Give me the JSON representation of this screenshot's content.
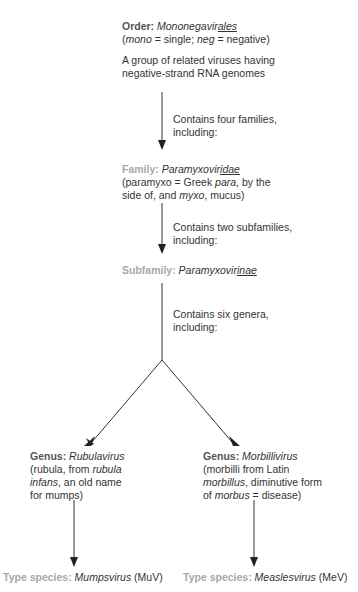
{
  "order": {
    "label": "Order:",
    "name_prefix": "Mononegavir",
    "name_suffix": "ales",
    "etym": [
      "mono",
      " = single; ",
      "neg",
      " = negative)"
    ],
    "description": "A group of related viruses having negative-strand RNA genomes"
  },
  "arrow1_text": "Contains four families, including:",
  "family": {
    "label": "Family:",
    "name_prefix": "Paramyxovir",
    "name_suffix": "idae",
    "etym_1": "(paramyxo = Greek ",
    "etym_para": "para",
    "etym_2": ", by the side of, and ",
    "etym_myxo": "myxo",
    "etym_3": ", mucus)"
  },
  "arrow2_text": "Contains two subfamilies, including:",
  "subfamily": {
    "label": "Subfamily:",
    "name_prefix": "Paramyxovir",
    "name_suffix": "inae"
  },
  "arrow3_text": "Contains six genera, including:",
  "genus_left": {
    "label": "Genus:",
    "name": "Rubulavirus",
    "etym_1": "(rubula, from ",
    "etym_it": "rubula infans",
    "etym_2": ", an old name for mumps)"
  },
  "genus_right": {
    "label": "Genus:",
    "name": "Morbillivirus",
    "etym_1": "(morbilli from Latin ",
    "etym_it1": "morbillus",
    "etym_2": ", diminutive form of ",
    "etym_it2": "morbus",
    "etym_3": " = disease)"
  },
  "species_left": {
    "label": "Type species:",
    "name": "Mumpsvirus",
    "abbr": "(MuV)"
  },
  "species_right": {
    "label": "Type species:",
    "name": "Measlesvirus",
    "abbr": "(MeV)"
  },
  "colors": {
    "dark_label": "#555555",
    "light_label": "#a8a8a8",
    "text": "#333333",
    "line": "#222222"
  }
}
